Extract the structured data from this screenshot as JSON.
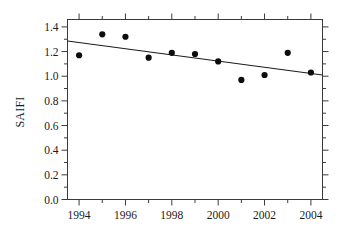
{
  "chart_data": {
    "type": "scatter",
    "title": "",
    "xlabel": "",
    "ylabel": "SAIFI",
    "x": [
      1994,
      1995,
      1996,
      1997,
      1998,
      1999,
      2000,
      2001,
      2002,
      2003,
      2004
    ],
    "values": [
      1.17,
      1.34,
      1.32,
      1.15,
      1.19,
      1.18,
      1.12,
      0.97,
      1.01,
      1.19,
      1.03
    ],
    "series": [
      {
        "name": "SAIFI",
        "type": "scatter",
        "values": [
          1.17,
          1.34,
          1.32,
          1.15,
          1.19,
          1.18,
          1.12,
          0.97,
          1.01,
          1.19,
          1.03
        ]
      },
      {
        "name": "trend",
        "type": "line",
        "x": [
          1993.5,
          2004.5
        ],
        "values": [
          1.285,
          1.01
        ]
      }
    ],
    "xlim": [
      1993.5,
      2004.5
    ],
    "ylim": [
      0.0,
      1.46
    ],
    "xticks": [
      1994,
      1996,
      1998,
      2000,
      2002,
      2004
    ],
    "xtick_labels": [
      "1994",
      "1996",
      "1998",
      "2000",
      "2002",
      "2004"
    ],
    "xticks_minor": [
      1995,
      1997,
      1999,
      2001,
      2003
    ],
    "yticks": [
      0.0,
      0.2,
      0.4,
      0.6,
      0.8,
      1.0,
      1.2,
      1.4
    ],
    "ytick_labels": [
      "0.0",
      "0.2",
      "0.4",
      "0.6",
      "0.8",
      "1.0",
      "1.2",
      "1.4"
    ],
    "grid": false,
    "legend": "none",
    "marker": "filled-circle",
    "marker_color": "#0d0d0d",
    "line_color": "#1b1b1b",
    "frame_color": "#3a3a3a",
    "background": "#ffffff"
  },
  "axes": {
    "y_title": "SAIFI"
  }
}
